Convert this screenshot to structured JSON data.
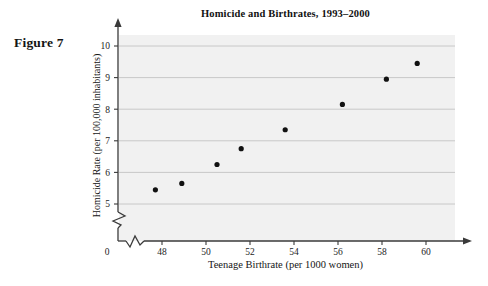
{
  "figure": {
    "caption": "Figure 7"
  },
  "chart_data": {
    "type": "scatter",
    "title": "Homicide and Birthrates, 1993–2000",
    "xlabel": "Teenage Birthrate (per 1000 women)",
    "ylabel": "Homicide Rate (per 100,000 inhabitants)",
    "xlim": [
      47,
      60.8
    ],
    "ylim": [
      4.8,
      10.4
    ],
    "xticks": [
      "0",
      "48",
      "50",
      "52",
      "54",
      "56",
      "58",
      "60"
    ],
    "yticks": [
      "5",
      "6",
      "7",
      "8",
      "9",
      "10"
    ],
    "grid": "horizontal",
    "legend": "none",
    "axis_break_x": true,
    "axis_break_y": true,
    "x": [
      47.7,
      48.9,
      50.5,
      51.6,
      53.6,
      56.2,
      58.2,
      59.6
    ],
    "y": [
      5.45,
      5.65,
      6.25,
      6.75,
      7.35,
      8.15,
      8.95,
      9.45
    ],
    "points": [
      {
        "x": 47.7,
        "y": 5.45
      },
      {
        "x": 48.9,
        "y": 5.65
      },
      {
        "x": 50.5,
        "y": 6.25
      },
      {
        "x": 51.6,
        "y": 6.75
      },
      {
        "x": 53.6,
        "y": 7.35
      },
      {
        "x": 56.2,
        "y": 8.15
      },
      {
        "x": 58.2,
        "y": 8.95
      },
      {
        "x": 59.6,
        "y": 9.45
      }
    ],
    "colors": {
      "plot_background": "#f1f1f1",
      "gridline": "#c8c8c8",
      "axis": "#3a3a3a",
      "marker": "#111111"
    }
  }
}
